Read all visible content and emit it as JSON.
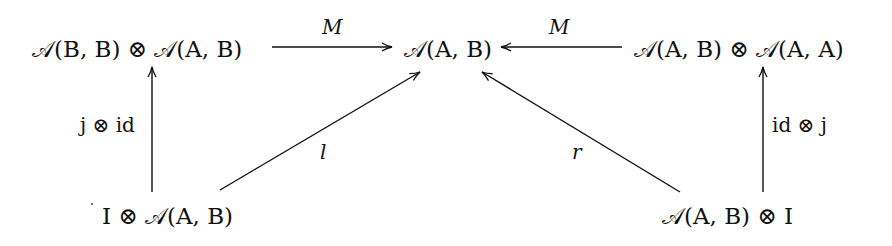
{
  "diagram": {
    "type": "commutative-diagram",
    "nodes": {
      "top_left": {
        "label": "𝒜(B, B) ⊗ 𝒜(A, B)"
      },
      "top_center": {
        "label": "𝒜(A, B)"
      },
      "top_right": {
        "label": "𝒜(A, B) ⊗ 𝒜(A, A)"
      },
      "bottom_left": {
        "label": "I ⊗ 𝒜(A, B)"
      },
      "bottom_right": {
        "label": "𝒜(A, B) ⊗ I"
      }
    },
    "arrows": {
      "m_left": {
        "label": "M",
        "from": "top_left",
        "to": "top_center"
      },
      "m_right": {
        "label": "M",
        "from": "top_right",
        "to": "top_center"
      },
      "j_id": {
        "label": "j ⊗ id",
        "from": "bottom_left",
        "to": "top_left"
      },
      "id_j": {
        "label": "id ⊗ j",
        "from": "bottom_right",
        "to": "top_right"
      },
      "l": {
        "label": "l",
        "from": "bottom_left",
        "to": "top_center"
      },
      "r": {
        "label": "r",
        "from": "bottom_right",
        "to": "top_center"
      }
    },
    "colors": {
      "ink": "#111111",
      "background": "#ffffff"
    }
  }
}
